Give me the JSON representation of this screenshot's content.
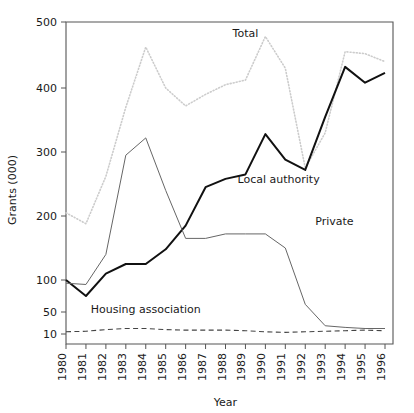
{
  "chart_data": {
    "type": "line",
    "title": "",
    "xlabel": "Year",
    "ylabel": "Grants (000)",
    "x": [
      1980,
      1981,
      1982,
      1983,
      1984,
      1985,
      1986,
      1987,
      1988,
      1989,
      1990,
      1991,
      1992,
      1993,
      1994,
      1995,
      1996
    ],
    "categories": [
      "1980",
      "1981",
      "1982",
      "1983",
      "1984",
      "1985",
      "1986",
      "1987",
      "1988",
      "1989",
      "1990",
      "1991",
      "1992",
      "1993",
      "1994",
      "1995",
      "1996"
    ],
    "ytick_labels": [
      "500",
      "400",
      "300",
      "200",
      "100",
      "50",
      "10"
    ],
    "ytick_values": [
      500,
      400,
      300,
      200,
      100,
      50,
      10
    ],
    "ylim": [
      10,
      500
    ],
    "y_axis_note": "broken/compressed below 100",
    "grid": false,
    "legend": "inline-labels",
    "series": [
      {
        "name": "Total",
        "style": "dotted",
        "color": "#cccccc",
        "label_x": 1989.0,
        "label_y": 478,
        "values": [
          205,
          188,
          262,
          370,
          462,
          400,
          372,
          390,
          405,
          412,
          478,
          430,
          275,
          330,
          455,
          452,
          440
        ]
      },
      {
        "name": "Local authority",
        "style": "solid-thick",
        "color": "#111111",
        "label_x": 1988.6,
        "label_y": 252,
        "values": [
          100,
          75,
          110,
          125,
          125,
          148,
          185,
          245,
          258,
          265,
          328,
          288,
          272,
          355,
          432,
          408,
          423
        ]
      },
      {
        "name": "Private",
        "style": "solid-thin",
        "color": "#666666",
        "label_x": 1992.5,
        "label_y": 186,
        "values": [
          95,
          93,
          140,
          295,
          322,
          240,
          165,
          165,
          172,
          172,
          172,
          150,
          62,
          25,
          22,
          20,
          20
        ]
      },
      {
        "name": "Housing association",
        "style": "dashed",
        "color": "#444444",
        "label_x": 1984.0,
        "label_y": 48,
        "values": [
          14,
          15,
          18,
          20,
          20,
          18,
          17,
          17,
          17,
          16,
          14,
          13,
          14,
          15,
          16,
          17,
          16
        ]
      }
    ]
  }
}
